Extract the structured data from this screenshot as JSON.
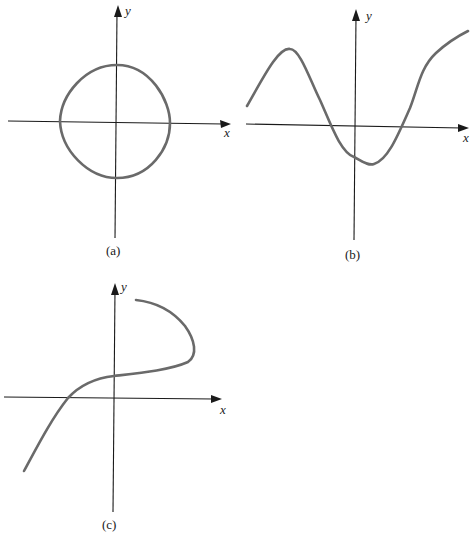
{
  "figure": {
    "panels": [
      {
        "id": "a",
        "caption": "(a)",
        "x_label": "x",
        "y_label": "y",
        "description": "closed rounded-square loop centered at origin"
      },
      {
        "id": "b",
        "caption": "(b)",
        "x_label": "x",
        "y_label": "y",
        "description": "wavy curve with local max left of y-axis and local min right of y-axis"
      },
      {
        "id": "c",
        "caption": "(c)",
        "x_label": "x",
        "y_label": "y",
        "description": "S-shaped curve that bends back (not a function of x)"
      }
    ]
  },
  "colors": {
    "axis": "#1a1a1a",
    "curve": "#6a6a6a",
    "background": "#ffffff"
  }
}
